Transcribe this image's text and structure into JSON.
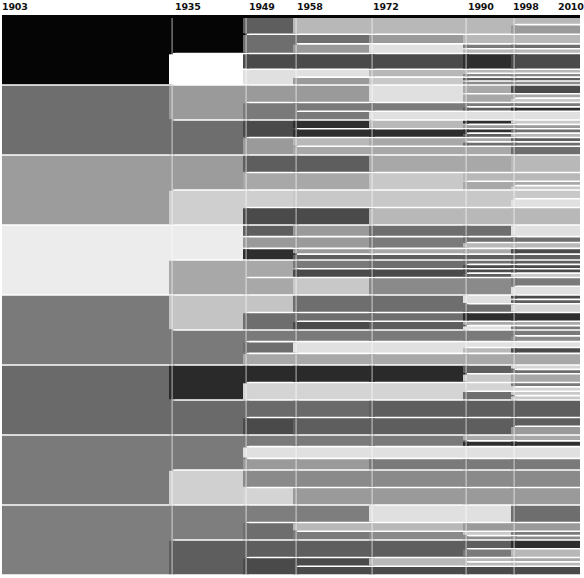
{
  "chart_data": {
    "type": "area",
    "title": "",
    "x_ticks": [
      "1903",
      "1935",
      "1949",
      "1958",
      "1972",
      "1990",
      "1998",
      "2010"
    ],
    "x_positions": [
      2,
      173,
      247,
      297,
      373,
      467,
      515,
      580
    ],
    "band_counts": {
      "1903": 8,
      "1935": 12,
      "1949": 32,
      "1958": 44,
      "1972": 46,
      "1990": 70,
      "1998": 90,
      "2010": 100
    },
    "top_y": 15,
    "bottom_y": 575,
    "level_1903_colors": [
      "#050505",
      "#6e6e6e",
      "#9c9c9c",
      "#ececec",
      "#7a7a7a",
      "#6a6a6a",
      "#7a7a7a",
      "#7e7e7e"
    ],
    "level_1935_splits": [
      {
        "parent": 0,
        "children": [
          {
            "frac": 0.55,
            "color": "#050505"
          },
          {
            "frac": 0.45,
            "color": "#ffffff"
          }
        ]
      },
      {
        "parent": 1,
        "children": [
          {
            "frac": 0.5,
            "color": "#9a9a9a"
          },
          {
            "frac": 0.5,
            "color": "#6e6e6e"
          }
        ]
      },
      {
        "parent": 2,
        "children": [
          {
            "frac": 0.5,
            "color": "#9c9c9c"
          },
          {
            "frac": 0.5,
            "color": "#cfcfcf"
          }
        ]
      },
      {
        "parent": 3,
        "children": [
          {
            "frac": 0.5,
            "color": "#ececec"
          },
          {
            "frac": 0.5,
            "color": "#a8a8a8"
          }
        ]
      },
      {
        "parent": 4,
        "children": [
          {
            "frac": 0.5,
            "color": "#c4c4c4"
          },
          {
            "frac": 0.5,
            "color": "#7a7a7a"
          }
        ]
      },
      {
        "parent": 5,
        "children": [
          {
            "frac": 0.5,
            "color": "#2a2a2a"
          },
          {
            "frac": 0.5,
            "color": "#6a6a6a"
          }
        ]
      },
      {
        "parent": 6,
        "children": [
          {
            "frac": 0.5,
            "color": "#7a7a7a"
          },
          {
            "frac": 0.5,
            "color": "#d0d0d0"
          }
        ]
      },
      {
        "parent": 7,
        "children": [
          {
            "frac": 0.5,
            "color": "#7e7e7e"
          },
          {
            "frac": 0.5,
            "color": "#5e5e5e"
          }
        ]
      }
    ]
  },
  "axis": {
    "years": [
      {
        "label": "1903",
        "x": 2
      },
      {
        "label": "1935",
        "x": 175
      },
      {
        "label": "1949",
        "x": 249
      },
      {
        "label": "1958",
        "x": 297
      },
      {
        "label": "1972",
        "x": 373
      },
      {
        "label": "1990",
        "x": 468
      },
      {
        "label": "1998",
        "x": 513
      },
      {
        "label": "2010",
        "x": 558
      }
    ]
  }
}
